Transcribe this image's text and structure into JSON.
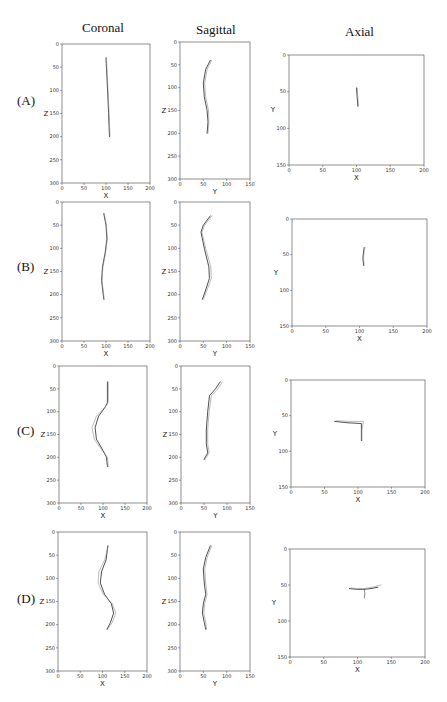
{
  "columns": [
    {
      "title": "Coronal"
    },
    {
      "title": "Sagittal"
    },
    {
      "title": "Axial"
    }
  ],
  "rows": [
    {
      "label": "(A)"
    },
    {
      "label": "(B)"
    },
    {
      "label": "(C)"
    },
    {
      "label": "(D)"
    }
  ],
  "chart_data": [
    {
      "panel": "A-coronal",
      "type": "line",
      "xlabel": "X",
      "ylabel": "Z",
      "xlim": [
        0,
        200
      ],
      "ylim": [
        300,
        0
      ],
      "xticks": [
        0,
        50,
        100,
        150,
        200
      ],
      "yticks": [
        0,
        50,
        100,
        150,
        200,
        250,
        300
      ],
      "series": [
        {
          "name": "predicted",
          "x": [
            100,
            102,
            104,
            106,
            108
          ],
          "y": [
            30,
            70,
            110,
            150,
            200
          ]
        },
        {
          "name": "ground_truth",
          "x": [
            101,
            103,
            105,
            107,
            109
          ],
          "y": [
            30,
            70,
            110,
            150,
            200
          ]
        }
      ]
    },
    {
      "panel": "A-sagittal",
      "type": "line",
      "xlabel": "Y",
      "ylabel": "Z",
      "xlim": [
        0,
        150
      ],
      "ylim": [
        300,
        0
      ],
      "xticks": [
        0,
        50,
        100,
        150
      ],
      "yticks": [
        0,
        50,
        100,
        150,
        200,
        250,
        300
      ],
      "series": [
        {
          "name": "predicted",
          "x": [
            65,
            55,
            50,
            52,
            58,
            60,
            58
          ],
          "y": [
            40,
            60,
            90,
            120,
            150,
            175,
            200
          ]
        },
        {
          "name": "ground_truth",
          "x": [
            68,
            58,
            53,
            55,
            61,
            62,
            60
          ],
          "y": [
            40,
            60,
            90,
            120,
            150,
            175,
            200
          ]
        }
      ]
    },
    {
      "panel": "A-axial",
      "type": "line",
      "xlabel": "X",
      "ylabel": "Y",
      "xlim": [
        0,
        200
      ],
      "ylim": [
        150,
        0
      ],
      "xticks": [
        0,
        50,
        100,
        150,
        200
      ],
      "yticks": [
        0,
        50,
        100,
        150
      ],
      "series": [
        {
          "name": "predicted",
          "x": [
            100,
            101,
            102
          ],
          "y": [
            45,
            58,
            70
          ]
        },
        {
          "name": "ground_truth",
          "x": [
            101,
            102,
            103
          ],
          "y": [
            45,
            58,
            70
          ]
        }
      ]
    },
    {
      "panel": "B-coronal",
      "type": "line",
      "xlabel": "X",
      "ylabel": "Z",
      "xlim": [
        0,
        200
      ],
      "ylim": [
        300,
        0
      ],
      "xticks": [
        0,
        50,
        100,
        150,
        200
      ],
      "yticks": [
        0,
        50,
        100,
        150,
        200,
        250,
        300
      ],
      "series": [
        {
          "name": "predicted",
          "x": [
            95,
            100,
            102,
            98,
            92,
            90,
            95
          ],
          "y": [
            25,
            50,
            80,
            110,
            140,
            170,
            210
          ]
        },
        {
          "name": "ground_truth",
          "x": [
            96,
            101,
            103,
            99,
            93,
            91,
            96
          ],
          "y": [
            25,
            50,
            80,
            110,
            140,
            170,
            210
          ]
        }
      ]
    },
    {
      "panel": "B-sagittal",
      "type": "line",
      "xlabel": "Y",
      "ylabel": "Z",
      "xlim": [
        0,
        150
      ],
      "ylim": [
        300,
        0
      ],
      "xticks": [
        0,
        50,
        100,
        150
      ],
      "yticks": [
        0,
        50,
        100,
        150,
        200,
        250,
        300
      ],
      "series": [
        {
          "name": "predicted",
          "x": [
            65,
            50,
            45,
            52,
            62,
            63,
            55,
            48
          ],
          "y": [
            30,
            50,
            65,
            100,
            140,
            165,
            190,
            210
          ]
        },
        {
          "name": "ground_truth",
          "x": [
            68,
            53,
            47,
            55,
            66,
            67,
            58,
            50
          ],
          "y": [
            30,
            50,
            65,
            100,
            140,
            165,
            190,
            210
          ]
        }
      ]
    },
    {
      "panel": "B-axial",
      "type": "line",
      "xlabel": "X",
      "ylabel": "Y",
      "xlim": [
        0,
        200
      ],
      "ylim": [
        150,
        0
      ],
      "xticks": [
        0,
        50,
        100,
        150,
        200
      ],
      "yticks": [
        0,
        50,
        100,
        150
      ],
      "series": [
        {
          "name": "predicted",
          "x": [
            107,
            106,
            105,
            106
          ],
          "y": [
            40,
            45,
            55,
            65
          ]
        },
        {
          "name": "ground_truth",
          "x": [
            108,
            107,
            106,
            107
          ],
          "y": [
            40,
            45,
            55,
            65
          ]
        }
      ]
    },
    {
      "panel": "C-coronal",
      "type": "line",
      "xlabel": "X",
      "ylabel": "Z",
      "xlim": [
        0,
        200
      ],
      "ylim": [
        300,
        0
      ],
      "xticks": [
        0,
        50,
        100,
        150,
        200
      ],
      "yticks": [
        0,
        50,
        100,
        150,
        200,
        250,
        300
      ],
      "series": [
        {
          "name": "predicted",
          "x": [
            110,
            110,
            105,
            90,
            82,
            85,
            100,
            108,
            110
          ],
          "y": [
            35,
            80,
            90,
            110,
            135,
            160,
            185,
            200,
            220
          ]
        },
        {
          "name": "ground_truth",
          "x": [
            112,
            112,
            105,
            85,
            75,
            80,
            98,
            110,
            112
          ],
          "y": [
            35,
            80,
            90,
            110,
            135,
            160,
            185,
            200,
            220
          ]
        }
      ]
    },
    {
      "panel": "C-sagittal",
      "type": "line",
      "xlabel": "Y",
      "ylabel": "Z",
      "xlim": [
        0,
        150
      ],
      "ylim": [
        300,
        0
      ],
      "xticks": [
        0,
        50,
        100,
        150
      ],
      "yticks": [
        0,
        50,
        100,
        150,
        200,
        250,
        300
      ],
      "series": [
        {
          "name": "predicted",
          "x": [
            85,
            75,
            62,
            58,
            55,
            55,
            58,
            50
          ],
          "y": [
            35,
            50,
            65,
            100,
            140,
            170,
            190,
            205
          ]
        },
        {
          "name": "ground_truth",
          "x": [
            90,
            80,
            66,
            61,
            58,
            58,
            61,
            52
          ],
          "y": [
            35,
            50,
            65,
            100,
            140,
            170,
            190,
            205
          ]
        }
      ]
    },
    {
      "panel": "C-axial",
      "type": "line",
      "xlabel": "X",
      "ylabel": "Y",
      "xlim": [
        0,
        200
      ],
      "ylim": [
        150,
        0
      ],
      "xticks": [
        0,
        50,
        100,
        150,
        200
      ],
      "yticks": [
        0,
        50,
        100,
        150
      ],
      "series": [
        {
          "name": "predicted",
          "x": [
            65,
            85,
            105,
            105,
            105
          ],
          "y": [
            58,
            60,
            61,
            70,
            85
          ]
        },
        {
          "name": "ground_truth",
          "x": [
            68,
            88,
            108,
            106,
            106
          ],
          "y": [
            57,
            58,
            58,
            70,
            85
          ]
        }
      ]
    },
    {
      "panel": "D-coronal",
      "type": "line",
      "xlabel": "X",
      "ylabel": "Z",
      "xlim": [
        0,
        200
      ],
      "ylim": [
        300,
        0
      ],
      "xticks": [
        0,
        50,
        100,
        150,
        200
      ],
      "yticks": [
        0,
        50,
        100,
        150,
        200,
        250,
        300
      ],
      "series": [
        {
          "name": "predicted",
          "x": [
            112,
            108,
            98,
            95,
            105,
            120,
            125,
            118,
            110
          ],
          "y": [
            30,
            60,
            85,
            110,
            135,
            155,
            175,
            195,
            210
          ]
        },
        {
          "name": "ground_truth",
          "x": [
            113,
            105,
            92,
            90,
            102,
            122,
            130,
            122,
            112
          ],
          "y": [
            30,
            60,
            85,
            110,
            135,
            155,
            175,
            195,
            210
          ]
        }
      ]
    },
    {
      "panel": "D-sagittal",
      "type": "line",
      "xlabel": "Y",
      "ylabel": "Z",
      "xlim": [
        0,
        150
      ],
      "ylim": [
        300,
        0
      ],
      "xticks": [
        0,
        50,
        100,
        150
      ],
      "yticks": [
        0,
        50,
        100,
        150,
        200,
        250,
        300
      ],
      "series": [
        {
          "name": "predicted",
          "x": [
            65,
            55,
            50,
            52,
            55,
            50,
            48,
            52,
            55
          ],
          "y": [
            30,
            55,
            80,
            110,
            135,
            155,
            175,
            195,
            210
          ]
        },
        {
          "name": "ground_truth",
          "x": [
            68,
            58,
            53,
            55,
            58,
            53,
            51,
            55,
            57
          ],
          "y": [
            30,
            55,
            80,
            110,
            135,
            155,
            175,
            195,
            210
          ]
        }
      ]
    },
    {
      "panel": "D-axial",
      "type": "line",
      "xlabel": "X",
      "ylabel": "Y",
      "xlim": [
        0,
        200
      ],
      "ylim": [
        150,
        0
      ],
      "xticks": [
        0,
        50,
        100,
        150,
        200
      ],
      "yticks": [
        0,
        50,
        100,
        150
      ],
      "series": [
        {
          "name": "predicted",
          "x": [
            88,
            100,
            110,
            120,
            130
          ],
          "y": [
            55,
            56,
            56,
            55,
            53
          ]
        },
        {
          "name": "ground_truth",
          "x": [
            90,
            100,
            110,
            122,
            135
          ],
          "y": [
            54,
            55,
            55,
            53,
            50
          ]
        },
        {
          "name": "branch",
          "x": [
            110,
            111,
            110
          ],
          "y": [
            56,
            62,
            68
          ]
        }
      ]
    }
  ]
}
